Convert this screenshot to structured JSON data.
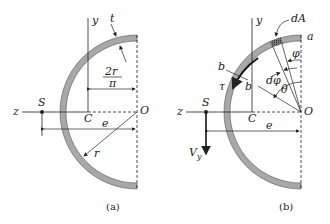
{
  "figure_a": {
    "caption": "(a)",
    "labels": {
      "y_axis": "y",
      "z_axis": "z",
      "thickness": "t",
      "centroid_distance_num": "2r",
      "centroid_distance_den": "π",
      "shear_center": "S",
      "centroid": "C",
      "center": "O",
      "eccentricity": "e",
      "radius": "r"
    }
  },
  "figure_b": {
    "caption": "(b)",
    "labels": {
      "y_axis": "y",
      "z_axis": "z",
      "element_area": "dA",
      "point_a": "a",
      "angle_phi": "φ",
      "angle_dphi": "dφ",
      "angle_theta": "θ",
      "section_b_outer": "b",
      "section_b_inner": "b",
      "shear_stress": "τ",
      "shear_center": "S",
      "centroid": "C",
      "center": "O",
      "eccentricity": "e",
      "shear_force": "V",
      "shear_force_sub": "y"
    }
  },
  "colors": {
    "section_fill": "#a8a8a8",
    "line": "#222222"
  }
}
